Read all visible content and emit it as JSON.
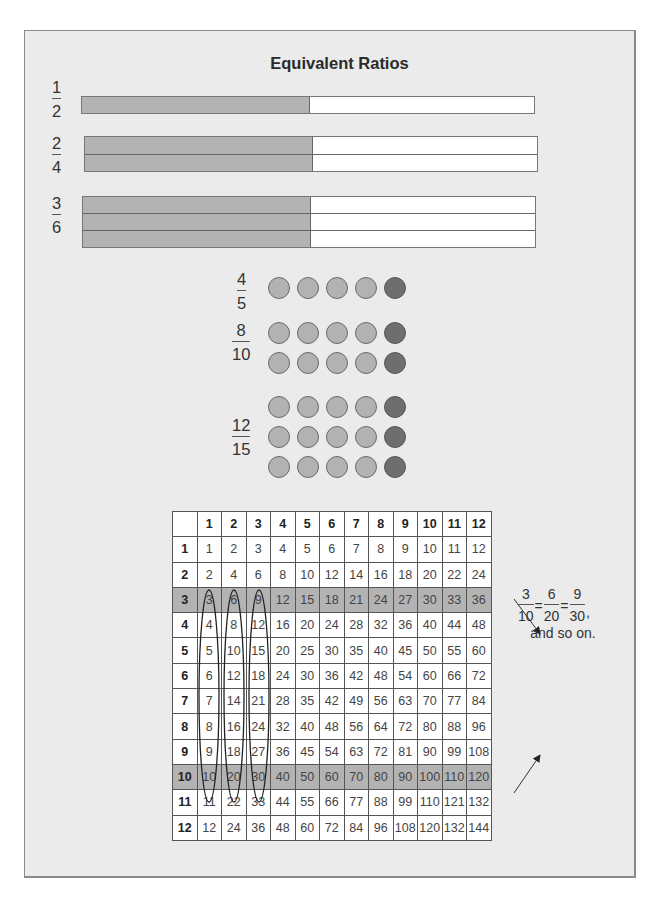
{
  "title": "Equivalent Ratios",
  "bars": [
    {
      "numerator": "1",
      "denominator": "2",
      "rows": 1
    },
    {
      "numerator": "2",
      "denominator": "4",
      "rows": 2
    },
    {
      "numerator": "3",
      "denominator": "6",
      "rows": 3
    }
  ],
  "dot_groups": [
    {
      "numerator": "4",
      "denominator": "5",
      "rows": 1,
      "light_per_row": 4,
      "dark_per_row": 1
    },
    {
      "numerator": "8",
      "denominator": "10",
      "rows": 2,
      "light_per_row": 4,
      "dark_per_row": 1
    },
    {
      "numerator": "12",
      "denominator": "15",
      "rows": 3,
      "light_per_row": 4,
      "dark_per_row": 1
    }
  ],
  "colors": {
    "background": "#ebebeb",
    "shade": "#b3b3b3",
    "dot_light": "#b2b2b2",
    "dot_dark": "#6e6e6e",
    "table_highlight": "#b3b3b3"
  },
  "table": {
    "column_headers": [
      "1",
      "2",
      "3",
      "4",
      "5",
      "6",
      "7",
      "8",
      "9",
      "10",
      "11",
      "12"
    ],
    "highlighted_rows": [
      "3",
      "10"
    ],
    "circled_columns": [
      "1",
      "2",
      "3"
    ],
    "rows": [
      {
        "label": "1",
        "values": [
          "1",
          "2",
          "3",
          "4",
          "5",
          "6",
          "7",
          "8",
          "9",
          "10",
          "11",
          "12"
        ]
      },
      {
        "label": "2",
        "values": [
          "2",
          "4",
          "6",
          "8",
          "10",
          "12",
          "14",
          "16",
          "18",
          "20",
          "22",
          "24"
        ]
      },
      {
        "label": "3",
        "values": [
          "3",
          "6",
          "9",
          "12",
          "15",
          "18",
          "21",
          "24",
          "27",
          "30",
          "33",
          "36"
        ]
      },
      {
        "label": "4",
        "values": [
          "4",
          "8",
          "12",
          "16",
          "20",
          "24",
          "28",
          "32",
          "36",
          "40",
          "44",
          "48"
        ]
      },
      {
        "label": "5",
        "values": [
          "5",
          "10",
          "15",
          "20",
          "25",
          "30",
          "35",
          "40",
          "45",
          "50",
          "55",
          "60"
        ]
      },
      {
        "label": "6",
        "values": [
          "6",
          "12",
          "18",
          "24",
          "30",
          "36",
          "42",
          "48",
          "54",
          "60",
          "66",
          "72"
        ]
      },
      {
        "label": "7",
        "values": [
          "7",
          "14",
          "21",
          "28",
          "35",
          "42",
          "49",
          "56",
          "63",
          "70",
          "77",
          "84"
        ]
      },
      {
        "label": "8",
        "values": [
          "8",
          "16",
          "24",
          "32",
          "40",
          "48",
          "56",
          "64",
          "72",
          "80",
          "88",
          "96"
        ]
      },
      {
        "label": "9",
        "values": [
          "9",
          "18",
          "27",
          "36",
          "45",
          "54",
          "63",
          "72",
          "81",
          "90",
          "99",
          "108"
        ]
      },
      {
        "label": "10",
        "values": [
          "10",
          "20",
          "30",
          "40",
          "50",
          "60",
          "70",
          "80",
          "90",
          "100",
          "110",
          "120"
        ]
      },
      {
        "label": "11",
        "values": [
          "11",
          "22",
          "33",
          "44",
          "55",
          "66",
          "77",
          "88",
          "99",
          "110",
          "121",
          "132"
        ]
      },
      {
        "label": "12",
        "values": [
          "12",
          "24",
          "36",
          "48",
          "60",
          "72",
          "84",
          "96",
          "108",
          "120",
          "132",
          "144"
        ]
      }
    ]
  },
  "note": {
    "fractions": [
      {
        "numerator": "3",
        "denominator": "10"
      },
      {
        "numerator": "6",
        "denominator": "20"
      },
      {
        "numerator": "9",
        "denominator": "30"
      }
    ],
    "equals": "=",
    "comma": ",",
    "caption": "and so on."
  }
}
